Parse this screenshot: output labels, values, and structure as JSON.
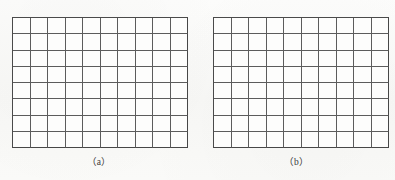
{
  "figure": {
    "background_color": "#fbfbfa",
    "line_color": "#5c5c5c",
    "border_color": "#474747",
    "panels": [
      {
        "id": "a",
        "caption": "（a）",
        "grid": {
          "columns": 10,
          "rows": 8,
          "cell_count": 80
        }
      },
      {
        "id": "b",
        "caption": "（b）",
        "grid": {
          "columns": 10,
          "rows": 8,
          "cell_count": 80
        }
      }
    ]
  },
  "chart_data": {
    "type": "table",
    "title": "",
    "xlabel": "",
    "ylabel": "",
    "grids": [
      {
        "label": "（a）",
        "columns": 10,
        "rows": 8,
        "cells_filled": 0,
        "cell_values": []
      },
      {
        "label": "（b）",
        "columns": 10,
        "rows": 8,
        "cells_filled": 0,
        "cell_values": []
      }
    ],
    "legend": [],
    "annotations": []
  }
}
